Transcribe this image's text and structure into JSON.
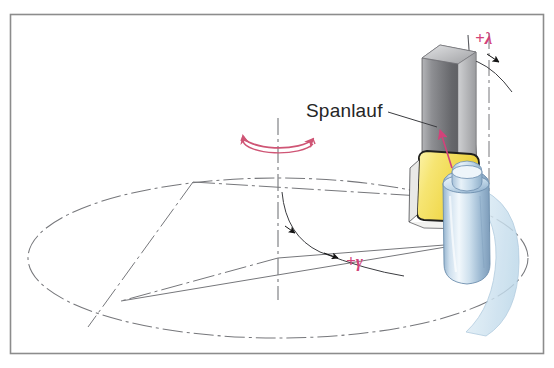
{
  "figure": {
    "kind": "technical-diagram",
    "background_color": "#ffffff",
    "frame": {
      "name": "figure-border",
      "color": "#8c8c8c",
      "x": 10,
      "y": 14,
      "width": 533,
      "height": 339
    }
  },
  "labels": {
    "chip_flow": {
      "text": "Spanlauf",
      "color": "#262626",
      "x": 306,
      "y": 117,
      "font_size": 19
    },
    "inclination_angle": {
      "text": "+λ",
      "color": "#d2427a",
      "x": 477,
      "y": 44,
      "font_size": 17
    },
    "rake_angle": {
      "text": "+γ",
      "color": "#d2427a",
      "x": 348,
      "y": 266,
      "font_size": 17
    }
  },
  "colors": {
    "accent_pink": "#d2427a",
    "rotation_arrow": "#cf5575",
    "line_grey": "#77787c",
    "thin_line": "#5a5b60",
    "frame_grey": "#8c8c8c",
    "block_dark": "#55565a",
    "block_mid": "#7f8083",
    "block_light": "#a9aaad",
    "insert_yellow": "#f2dd5c",
    "insert_yellow_light": "#faf0a8",
    "insert_outline": "#2c2c2c",
    "tool_blue": "#b9cfe2",
    "tool_blue_light": "#e4eef7",
    "tool_blue_dark": "#7fa0bd",
    "chip_surface": "#d7e7f2",
    "text_dark": "#262626"
  },
  "geometry": {
    "ellipse": {
      "name": "rotation-path-ellipse",
      "center_x": 278,
      "center_y": 258,
      "radius_x": 250,
      "radius_y": 80,
      "style": "dash-dot"
    },
    "vertical_axis": {
      "name": "rotation-axis",
      "x": 278,
      "y_top": 120,
      "y_bottom": 300,
      "style": "dash-dot"
    },
    "rotation_arrow": {
      "name": "rotation-direction-arrow",
      "center_x": 278,
      "center_y": 142,
      "radius_x": 36,
      "radius_y": 13,
      "double_headed": true
    },
    "chords": [
      {
        "name": "chord-left",
        "x1": 193,
        "y1": 183,
        "x2": 88,
        "y2": 326
      },
      {
        "name": "chord-right",
        "x1": 278,
        "y1": 258,
        "x2": 122,
        "y2": 302
      },
      {
        "name": "chord-to-tool",
        "x1": 278,
        "y1": 258,
        "x2": 470,
        "y2": 243
      }
    ],
    "grey_block": {
      "name": "workpiece-block",
      "x": 422,
      "y": 45,
      "width": 56,
      "height": 145
    },
    "insert_plate": {
      "name": "cutting-insert-plate",
      "x": 416,
      "y": 152,
      "width": 62,
      "height": 72
    },
    "tool_cylinder": {
      "name": "cutting-tool-cylinder",
      "cx": 466,
      "cy": 225,
      "width": 46,
      "height": 110
    },
    "chip_surface": {
      "name": "chip-surface",
      "x": 478,
      "y": 180,
      "width": 44,
      "height": 155
    }
  },
  "annotations": {
    "chip_flow_leader": {
      "name": "spanlauf-leader-line",
      "x1": 386,
      "y1": 113,
      "x2": 436,
      "y2": 128
    },
    "chip_flow_arrow": {
      "name": "chip-flow-arrow",
      "tip_x": 440,
      "tip_y": 127,
      "tail_x": 455,
      "tail_y": 163,
      "color": "#d2427a"
    },
    "lambda_arc": {
      "name": "inclination-angle-arc",
      "arrowheads": 2
    },
    "gamma_arc": {
      "name": "rake-angle-arc",
      "arrowheads": 2
    }
  }
}
